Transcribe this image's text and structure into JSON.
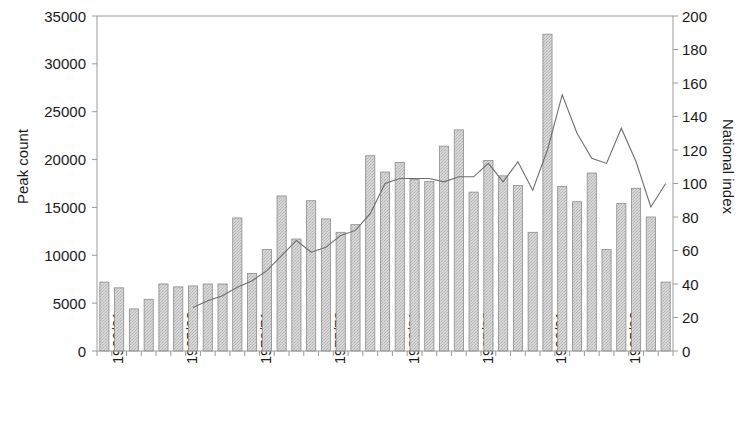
{
  "chart_data": {
    "type": "bar",
    "title": "",
    "subtitle": "",
    "xlabel": "",
    "ylabel": "Peak count",
    "y2label": "National index",
    "grid": false,
    "legend": "none",
    "ylim": [
      0,
      35000
    ],
    "y2lim": [
      0,
      200
    ],
    "ytick_step": 5000,
    "y2tick_step": 20,
    "yticks": [
      "0",
      "5000",
      "10000",
      "15000",
      "20000",
      "25000",
      "30000",
      "35000"
    ],
    "y2ticks": [
      "0",
      "20",
      "40",
      "60",
      "80",
      "100",
      "120",
      "140",
      "160",
      "180",
      "200"
    ],
    "categories": [
      "1960/61",
      "1961/62",
      "1962/63",
      "1963/64",
      "1964/65",
      "1965/66",
      "1966/67",
      "1967/68",
      "1968/69",
      "1969/70",
      "1970/71",
      "1971/72",
      "1972/73",
      "1973/74",
      "1974/75",
      "1975/76",
      "1976/77",
      "1977/78",
      "1978/79",
      "1979/80",
      "1980/81",
      "1981/82",
      "1982/83",
      "1983/84",
      "1984/85",
      "1985/86",
      "1986/87",
      "1987/88",
      "1988/89",
      "1989/90",
      "1990/91",
      "1991/92",
      "1992/93",
      "1993/94",
      "1994/95",
      "1995/96",
      "1996/97",
      "1997/98",
      "1998/99"
    ],
    "xtick_labels": [
      "1960/61",
      "1965/66",
      "1970/71",
      "1975/76",
      "1980/81",
      "1985/86",
      "1990/91",
      "1995/96"
    ],
    "xtick_indices": [
      0,
      5,
      10,
      15,
      20,
      25,
      30,
      35
    ],
    "series": [
      {
        "name": "Peak count",
        "type": "bar",
        "axis": "left",
        "color": "#c9c9c9",
        "edge_color": "#8c8c8c",
        "values": [
          7200,
          6600,
          4400,
          5400,
          7000,
          6700,
          6800,
          7000,
          7000,
          13900,
          8100,
          10600,
          16200,
          11700,
          15700,
          13800,
          12400,
          13200,
          20400,
          18700,
          19700,
          17900,
          17700,
          21400,
          23100,
          16600,
          19900,
          18300,
          17300,
          12400,
          33100,
          17200,
          15600,
          18600,
          10600,
          15400,
          17000,
          14000,
          7200
        ]
      },
      {
        "name": "National index",
        "type": "line",
        "axis": "right",
        "color": "#6e6e6e",
        "x_start_index": 6,
        "values": [
          null,
          null,
          null,
          null,
          null,
          null,
          26,
          30,
          33,
          38,
          42,
          48,
          57,
          66,
          59,
          62,
          69,
          72,
          82,
          100,
          103,
          103,
          103,
          101,
          104,
          104,
          112,
          101,
          113,
          96,
          120,
          153,
          130,
          115,
          112,
          133,
          113,
          86,
          100
        ]
      }
    ]
  }
}
